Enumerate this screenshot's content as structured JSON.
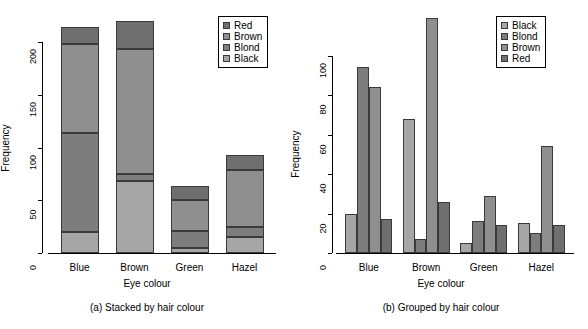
{
  "figure": {
    "dataset_title": "",
    "background": "#ffffff",
    "text_color": "#000000"
  },
  "palette": {
    "black_hair": "#a6a6a6",
    "blond_hair": "#7d7d7d",
    "brown_hair": "#8f8f8f",
    "red_hair": "#6f6f6f",
    "bar_border": "#3a3a3a",
    "axis": "#000000"
  },
  "chart_data": [
    {
      "id": "panel-a",
      "type": "bar",
      "subtype": "stacked",
      "title": "",
      "caption": "(a) Stacked by hair colour",
      "xlabel": "Eye colour",
      "ylabel": "Frequency",
      "grid": false,
      "categories": [
        "Blue",
        "Brown",
        "Green",
        "Hazel"
      ],
      "ylim": [
        0,
        225
      ],
      "yticks": [
        0,
        50,
        100,
        150,
        200
      ],
      "ytick_labels": [
        "0",
        "50",
        "100",
        "150",
        "200"
      ],
      "stack_order_bottom_to_top": [
        "Black",
        "Blond",
        "Brown",
        "Red"
      ],
      "series": [
        {
          "name": "Black",
          "color": "#a6a6a6",
          "values": [
            20,
            68,
            5,
            15
          ]
        },
        {
          "name": "Blond",
          "color": "#7d7d7d",
          "values": [
            94,
            7,
            16,
            10
          ]
        },
        {
          "name": "Brown",
          "color": "#8f8f8f",
          "values": [
            84,
            119,
            29,
            54
          ]
        },
        {
          "name": "Red",
          "color": "#6f6f6f",
          "values": [
            17,
            26,
            14,
            14
          ]
        }
      ],
      "totals": [
        215,
        220,
        64,
        93
      ],
      "legend": {
        "position": "top-right",
        "entries": [
          {
            "label": "Red",
            "color": "#6f6f6f"
          },
          {
            "label": "Brown",
            "color": "#8f8f8f"
          },
          {
            "label": "Blond",
            "color": "#7d7d7d"
          },
          {
            "label": "Black",
            "color": "#a6a6a6"
          }
        ]
      }
    },
    {
      "id": "panel-b",
      "type": "bar",
      "subtype": "grouped",
      "title": "",
      "caption": "(b) Grouped by hair colour",
      "xlabel": "Eye colour",
      "ylabel": "Frequency",
      "grid": false,
      "categories": [
        "Blue",
        "Brown",
        "Green",
        "Hazel"
      ],
      "ylim": [
        0,
        120
      ],
      "yticks": [
        0,
        20,
        40,
        60,
        80,
        100
      ],
      "ytick_labels": [
        "0",
        "20",
        "40",
        "60",
        "80",
        "100"
      ],
      "group_order_left_to_right": [
        "Black",
        "Blond",
        "Brown",
        "Red"
      ],
      "series": [
        {
          "name": "Black",
          "color": "#a6a6a6",
          "values": [
            20,
            68,
            5,
            15
          ]
        },
        {
          "name": "Blond",
          "color": "#7d7d7d",
          "values": [
            94,
            7,
            16,
            10
          ]
        },
        {
          "name": "Brown",
          "color": "#8f8f8f",
          "values": [
            84,
            119,
            29,
            54
          ]
        },
        {
          "name": "Red",
          "color": "#6f6f6f",
          "values": [
            17,
            26,
            14,
            14
          ]
        }
      ],
      "legend": {
        "position": "top-right",
        "entries": [
          {
            "label": "Black",
            "color": "#a6a6a6"
          },
          {
            "label": "Blond",
            "color": "#7d7d7d"
          },
          {
            "label": "Brown",
            "color": "#8f8f8f"
          },
          {
            "label": "Red",
            "color": "#6f6f6f"
          }
        ]
      }
    }
  ]
}
